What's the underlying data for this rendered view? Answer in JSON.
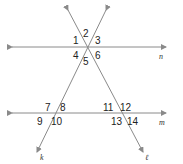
{
  "diagram": {
    "lines": [
      {
        "name": "n",
        "type": "horizontal"
      },
      {
        "name": "m",
        "type": "horizontal"
      },
      {
        "name": "k",
        "type": "transversal"
      },
      {
        "name": "ℓ",
        "type": "transversal"
      }
    ],
    "angles_top": [
      "1",
      "2",
      "3",
      "4",
      "5",
      "6"
    ],
    "angles_bottom_left": [
      "7",
      "8",
      "9",
      "10"
    ],
    "angles_bottom_right": [
      "11",
      "12",
      "13",
      "14"
    ],
    "labels": {
      "n": "n",
      "m": "m",
      "k": "k",
      "l": "ℓ"
    },
    "colors": {
      "line": "#8a8a8a",
      "text": "#222222"
    }
  }
}
